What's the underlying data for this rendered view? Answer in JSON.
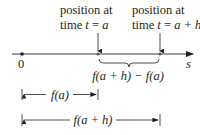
{
  "diagram": {
    "axis": {
      "variable_label": "s",
      "origin_label": "0"
    },
    "annotations": {
      "left": {
        "line1": "position at",
        "line2_prefix": "time ",
        "line2_var": "t",
        "line2_eq": " = ",
        "line2_val": "a"
      },
      "right": {
        "line1": "position at",
        "line2_prefix": "time ",
        "line2_var": "t",
        "line2_eq": " = ",
        "line2_val": "a + h"
      }
    },
    "difference_label": "f(a + h) − f(a)",
    "measure_fa": "f(a)",
    "measure_fah": "f(a + h)",
    "colors": {
      "ink": "#231f20",
      "line": "#3a3a3a"
    }
  }
}
